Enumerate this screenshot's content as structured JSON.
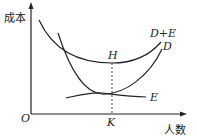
{
  "diagram": {
    "y_axis_label": "成本",
    "x_axis_label": "人数",
    "origin_label": "O",
    "curves": [
      {
        "name": "D+E",
        "label": "D+E"
      },
      {
        "name": "D",
        "label": "D"
      },
      {
        "name": "E",
        "label": "E"
      }
    ],
    "points": {
      "min_point_label": "H",
      "x_point_label": "K"
    }
  }
}
